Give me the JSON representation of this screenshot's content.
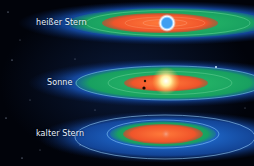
{
  "diagram": {
    "systems": [
      {
        "label": "heißer Stern",
        "star_color": "#4da6ff",
        "zones": {
          "hot": "#f25a2e",
          "habitable": "#1fa866",
          "cold": "#1e6fd9"
        }
      },
      {
        "label": "Sonne",
        "star_color": "#fff3b0",
        "zones": {
          "hot": "#f25a2e",
          "habitable": "#1fa866",
          "cold": "#1e6fd9"
        }
      },
      {
        "label": "kalter Stern",
        "star_color": "#f07a5a",
        "zones": {
          "hot": "#f25a2e",
          "habitable": "#1fa866",
          "cold": "#1e6fd9"
        }
      }
    ]
  }
}
